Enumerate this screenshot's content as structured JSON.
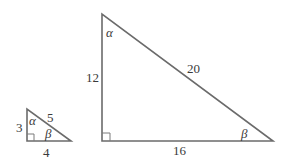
{
  "diagram": {
    "type": "similar-right-triangles",
    "colors": {
      "line": "#6b6b6b",
      "text": "#3a3a3a",
      "background": "#ffffff"
    },
    "small_triangle": {
      "legs": {
        "vertical": "3",
        "horizontal": "4"
      },
      "hypotenuse": "5",
      "angles": {
        "top": "α",
        "bottom_right": "β"
      },
      "right_angle_marker": true
    },
    "large_triangle": {
      "legs": {
        "vertical": "12",
        "horizontal": "16"
      },
      "hypotenuse": "20",
      "angles": {
        "top": "α",
        "bottom_right": "β"
      },
      "right_angle_marker": true
    }
  }
}
